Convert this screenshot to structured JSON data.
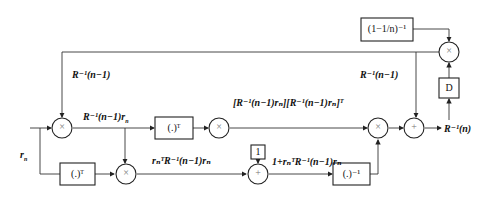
{
  "diagram": {
    "type": "block-diagram",
    "title": "",
    "labels": {
      "input": "r",
      "input_sub": "n",
      "feedback": "R⁻¹(n−1)",
      "feedback_right": "R⁻¹(n−1)",
      "mult1_out": "R⁻¹(n−1)r",
      "mult1_out_sub": "n",
      "outer_product": "[R⁻¹(n−1)rₙ][R⁻¹(n−1)rₙ]ᵀ",
      "quad_form": "rₙᵀR⁻¹(n−1)rₙ",
      "denominator": "1+rₙᵀR⁻¹(n−1)rₙ",
      "output": "R⁻¹(n)"
    },
    "boxes": {
      "forget_factor": "(1−1/n)⁻¹",
      "delay": "D",
      "transpose_top": "(.)ᵀ",
      "transpose_bottom": "(.)ᵀ",
      "one": "1",
      "inverse": "(.)⁻¹"
    },
    "operators": {
      "multiply": "×",
      "add": "+"
    }
  }
}
